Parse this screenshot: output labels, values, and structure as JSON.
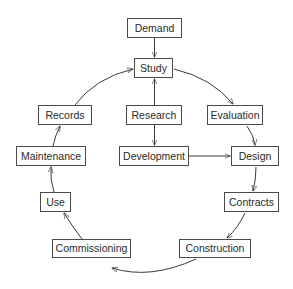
{
  "diagram": {
    "type": "cycle-flowchart",
    "colors": {
      "stroke": "#3a3a3a",
      "border": "#4a4a4a",
      "text": "#2a2a2a",
      "background": "#ffffff"
    },
    "nodes": {
      "demand": {
        "label": "Demand",
        "box": [
          127,
          18,
          55,
          20
        ]
      },
      "study": {
        "label": "Study",
        "box": [
          134,
          58,
          39,
          20
        ]
      },
      "records": {
        "label": "Records",
        "box": [
          38,
          105,
          54,
          20
        ]
      },
      "research": {
        "label": "Research",
        "box": [
          126,
          105,
          56,
          20
        ]
      },
      "evaluation": {
        "label": "Evaluation",
        "box": [
          207,
          105,
          56,
          20
        ]
      },
      "maintenance": {
        "label": "Maintenance",
        "box": [
          16,
          146,
          70,
          20
        ]
      },
      "development": {
        "label": "Development",
        "box": [
          119,
          146,
          70,
          20
        ]
      },
      "design": {
        "label": "Design",
        "box": [
          231,
          146,
          48,
          20
        ]
      },
      "use": {
        "label": "Use",
        "box": [
          40,
          192,
          31,
          20
        ]
      },
      "contracts": {
        "label": "Contracts",
        "box": [
          224,
          192,
          55,
          20
        ]
      },
      "commissioning": {
        "label": "Commissioning",
        "box": [
          52,
          239,
          79,
          19
        ]
      },
      "construction": {
        "label": "Construction",
        "box": [
          179,
          239,
          72,
          19
        ]
      }
    },
    "edges": [
      {
        "from": "Demand",
        "to": "Study"
      },
      {
        "from": "Research",
        "to": "Study"
      },
      {
        "from": "Research",
        "to": "Development"
      },
      {
        "from": "Development",
        "to": "Design"
      },
      {
        "from": "Study",
        "to": "Evaluation"
      },
      {
        "from": "Evaluation",
        "to": "Design"
      },
      {
        "from": "Design",
        "to": "Contracts"
      },
      {
        "from": "Contracts",
        "to": "Construction"
      },
      {
        "from": "Construction",
        "to": "Commissioning"
      },
      {
        "from": "Commissioning",
        "to": "Use"
      },
      {
        "from": "Use",
        "to": "Maintenance"
      },
      {
        "from": "Maintenance",
        "to": "Records"
      },
      {
        "from": "Records",
        "to": "Study"
      }
    ]
  }
}
